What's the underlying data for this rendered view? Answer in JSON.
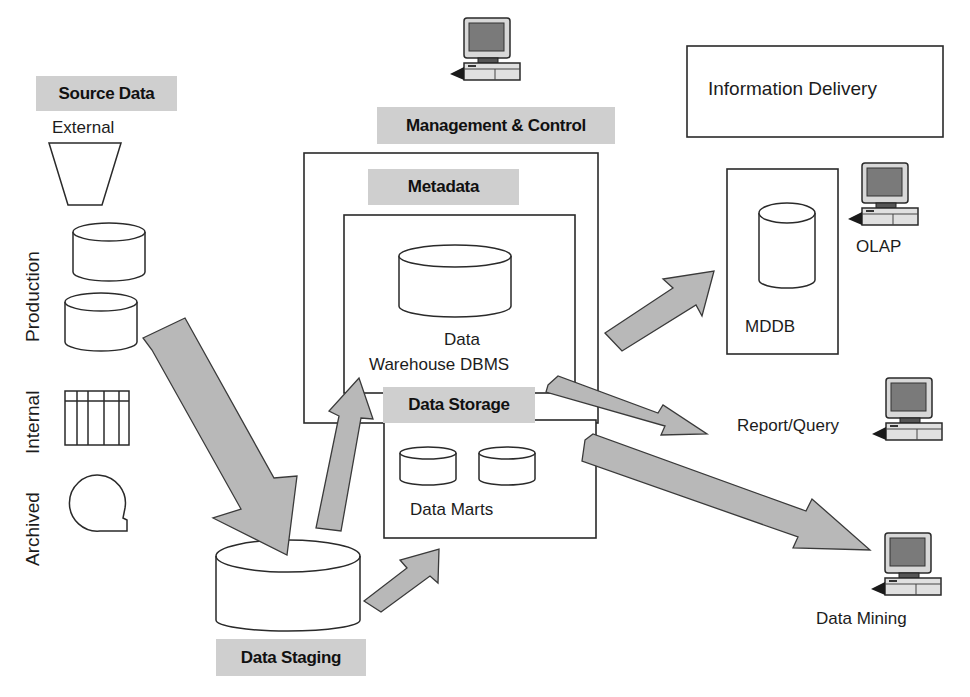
{
  "source": {
    "header": "Source Data",
    "external_label": "External",
    "vertical_labels": [
      "Production",
      "Internal",
      "Archived"
    ]
  },
  "management": {
    "label": "Management & Control"
  },
  "metadata": {
    "label": "Metadata"
  },
  "dw_dbms": {
    "line1": "Data",
    "line2": "Warehouse DBMS"
  },
  "storage": {
    "label": "Data Storage",
    "data_marts_label": "Data Marts"
  },
  "staging": {
    "label": "Data Staging"
  },
  "delivery": {
    "header": "Information Delivery",
    "mddb_label": "MDDB",
    "tools": [
      {
        "label": "OLAP",
        "icon": "computer-icon"
      },
      {
        "label": "Report/Query",
        "icon": "computer-icon"
      },
      {
        "label": "Data Mining",
        "icon": "computer-icon"
      }
    ]
  },
  "colors": {
    "tag_bg": "#cfcfcf",
    "arrow_fill": "#b8b8b8",
    "arrow_stroke": "#3a3a3a",
    "line": "#2a2a2a",
    "screen": "#7a7a7a"
  }
}
